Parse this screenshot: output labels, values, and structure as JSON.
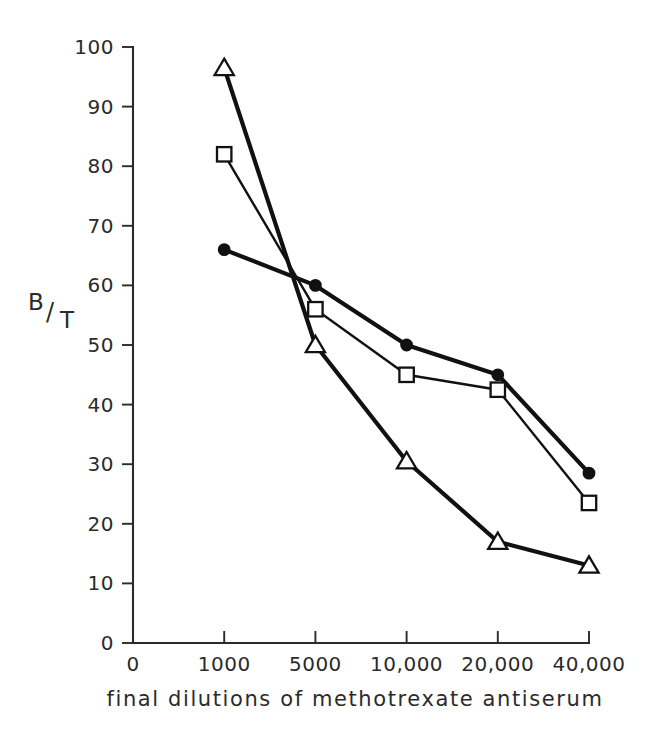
{
  "chart_data": {
    "type": "line",
    "title": "",
    "xlabel": "final dilutions of methotrexate antiserum",
    "ylabel": "B/T",
    "ylabel_numerator": "B",
    "ylabel_slash": "/",
    "ylabel_denominator": "T",
    "grid": false,
    "legend": "none",
    "categories": [
      "0",
      "1000",
      "5000",
      "10,000",
      "20,000",
      "40,000"
    ],
    "x_tick_labels": [
      "0",
      "1000",
      "5000",
      "10,000",
      "20,000",
      "40,000"
    ],
    "y_tick_labels": [
      "0",
      "10",
      "20",
      "30",
      "40",
      "50",
      "60",
      "70",
      "80",
      "90",
      "100"
    ],
    "y_ticks": [
      0,
      10,
      20,
      30,
      40,
      50,
      60,
      70,
      80,
      90,
      100
    ],
    "ylim": [
      0,
      100
    ],
    "series": [
      {
        "name": "filled-circle-series",
        "marker": "filled-circle",
        "line_weight": "thick",
        "x": [
          "1000",
          "5000",
          "10,000",
          "20,000",
          "40,000"
        ],
        "values": [
          66,
          60,
          50,
          45,
          28.5
        ]
      },
      {
        "name": "open-square-series",
        "marker": "open-square",
        "line_weight": "thin",
        "x": [
          "1000",
          "5000",
          "10,000",
          "20,000",
          "40,000"
        ],
        "values": [
          82,
          56,
          45,
          42.5,
          23.5
        ]
      },
      {
        "name": "open-triangle-series",
        "marker": "open-triangle",
        "line_weight": "thick",
        "x": [
          "1000",
          "5000",
          "10,000",
          "20,000",
          "40,000"
        ],
        "values": [
          96.5,
          50,
          30.5,
          17,
          13
        ]
      }
    ]
  },
  "colors": {
    "background": "#ffffff",
    "ink": "#111111",
    "axis": "#2b2b2b"
  }
}
